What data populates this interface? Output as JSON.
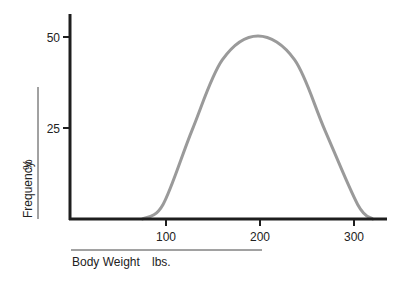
{
  "chart_data": {
    "type": "line",
    "title": "",
    "xlabel": "Body Weight",
    "xunit": "lbs.",
    "ylabel": "Frequency",
    "yunit": "%",
    "xticks": [
      100,
      200,
      300
    ],
    "yticks": [
      25,
      50
    ],
    "xlim": [
      0,
      335
    ],
    "ylim": [
      0,
      56
    ],
    "grid": false,
    "legend": null,
    "series": [
      {
        "name": "Body weight distribution",
        "color": "#9a9a9a",
        "x": [
          77,
          99,
          130,
          162,
          200,
          239,
          271,
          306,
          322
        ],
        "y": [
          0,
          4,
          24.5,
          43.7,
          50.3,
          43.7,
          24.5,
          4,
          0
        ]
      }
    ]
  },
  "labels": {
    "x_tick_100": "100",
    "x_tick_200": "200",
    "x_tick_300": "300",
    "y_tick_25": "25",
    "y_tick_50": "50",
    "x_title": "Body Weight",
    "x_unit": "lbs.",
    "y_title": "Frequency",
    "y_unit": "%"
  },
  "colors": {
    "axis": "#1e1e1e",
    "curve": "#9a9a9a",
    "background": "#ffffff"
  }
}
